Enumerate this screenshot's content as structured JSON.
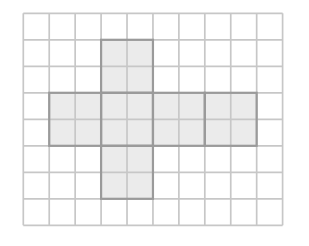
{
  "figure": {
    "type": "cube-net-on-grid-paper",
    "background_color": "#ffffff",
    "grid": {
      "columns": 10,
      "rows": 8,
      "origin_x": 23.3,
      "origin_y": 13.3,
      "cell_width": 25.93,
      "cell_height": 26.5,
      "line_color": "#c7c7c7",
      "line_width": 1.7
    },
    "net": {
      "fill_color": "#ebebeb",
      "border_color": "#9a9a9a",
      "border_width": 2.2,
      "block_size_cells": 2,
      "blocks": [
        {
          "col": 3,
          "row": 1
        },
        {
          "col": 1,
          "row": 3
        },
        {
          "col": 3,
          "row": 3
        },
        {
          "col": 5,
          "row": 3
        },
        {
          "col": 7,
          "row": 3
        },
        {
          "col": 3,
          "row": 5
        }
      ]
    }
  }
}
